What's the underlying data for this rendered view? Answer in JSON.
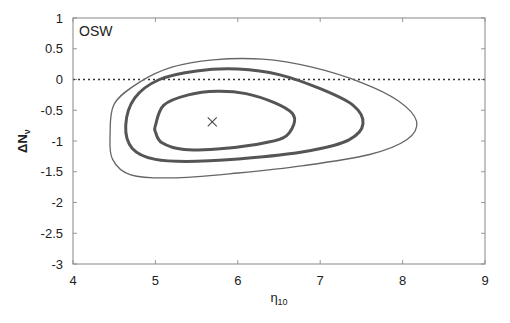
{
  "chart_data": {
    "type": "line",
    "subtype": "contour",
    "title": "",
    "panel_label": "OSW",
    "xlabel": "η10",
    "xlabel_main": "η",
    "xlabel_sub": "10",
    "ylabel": "ΔNν",
    "ylabel_main": "ΔN",
    "ylabel_sub": "ν",
    "xlim": [
      4,
      9
    ],
    "ylim": [
      -3,
      1
    ],
    "xticks": [
      4,
      5,
      6,
      7,
      8,
      9
    ],
    "xtick_labels": [
      "4",
      "5",
      "6",
      "7",
      "8",
      "9"
    ],
    "yticks": [
      1,
      0.5,
      0,
      -0.5,
      -1,
      -1.5,
      -2,
      -2.5,
      -3
    ],
    "ytick_labels": [
      "1",
      "0.5",
      "0",
      "-0.5",
      "-1",
      "-1.5",
      "-2",
      "-2.5",
      "-3"
    ],
    "grid": false,
    "legend": null,
    "best_fit": {
      "x": 5.69,
      "y": -0.69,
      "marker": "x"
    },
    "reference_line": {
      "y": 0,
      "style": "dotted"
    },
    "series": [
      {
        "name": "inner contour",
        "line_width": "thick",
        "points": [
          [
            5.0,
            -0.75
          ],
          [
            5.1,
            -0.42
          ],
          [
            5.4,
            -0.25
          ],
          [
            5.75,
            -0.19
          ],
          [
            6.1,
            -0.23
          ],
          [
            6.45,
            -0.38
          ],
          [
            6.66,
            -0.55
          ],
          [
            6.68,
            -0.73
          ],
          [
            6.55,
            -0.95
          ],
          [
            6.2,
            -1.06
          ],
          [
            5.75,
            -1.13
          ],
          [
            5.35,
            -1.14
          ],
          [
            5.08,
            -1.03
          ],
          [
            5.0,
            -0.85
          ]
        ]
      },
      {
        "name": "middle contour",
        "line_width": "thick",
        "points": [
          [
            4.64,
            -0.75
          ],
          [
            4.75,
            -0.3
          ],
          [
            5.05,
            0.0
          ],
          [
            5.5,
            0.14
          ],
          [
            6.0,
            0.17
          ],
          [
            6.5,
            0.08
          ],
          [
            7.0,
            -0.15
          ],
          [
            7.4,
            -0.42
          ],
          [
            7.52,
            -0.72
          ],
          [
            7.35,
            -0.98
          ],
          [
            6.9,
            -1.15
          ],
          [
            6.2,
            -1.27
          ],
          [
            5.5,
            -1.33
          ],
          [
            5.0,
            -1.3
          ],
          [
            4.72,
            -1.12
          ]
        ]
      },
      {
        "name": "outer contour",
        "line_width": "thin",
        "points": [
          [
            4.45,
            -0.9
          ],
          [
            4.5,
            -0.4
          ],
          [
            4.8,
            -0.05
          ],
          [
            5.2,
            0.2
          ],
          [
            5.7,
            0.32
          ],
          [
            6.3,
            0.33
          ],
          [
            6.9,
            0.2
          ],
          [
            7.5,
            -0.05
          ],
          [
            7.95,
            -0.35
          ],
          [
            8.17,
            -0.68
          ],
          [
            8.05,
            -0.98
          ],
          [
            7.6,
            -1.22
          ],
          [
            6.8,
            -1.4
          ],
          [
            6.0,
            -1.52
          ],
          [
            5.2,
            -1.6
          ],
          [
            4.7,
            -1.55
          ],
          [
            4.48,
            -1.3
          ]
        ]
      }
    ]
  }
}
